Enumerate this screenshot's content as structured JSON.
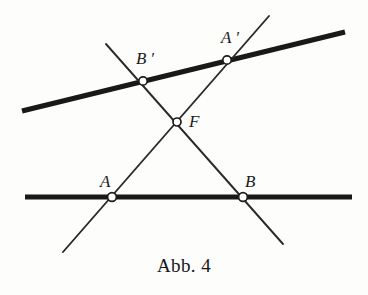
{
  "figure": {
    "caption": "Abb. 4",
    "caption_x": 184,
    "caption_y": 255,
    "caption_font_size": 19,
    "background_color": "#fdfdfc",
    "ink_color": "#1c1c1c",
    "canvas": {
      "width": 368,
      "height": 295
    }
  },
  "labels": [
    {
      "name": "label-b-prime",
      "text": "B ′",
      "x": 136,
      "y": 50,
      "font_size": 17
    },
    {
      "name": "label-a-prime",
      "text": "A ′",
      "x": 221,
      "y": 29,
      "font_size": 17
    },
    {
      "name": "label-f",
      "text": "F",
      "x": 189,
      "y": 113,
      "font_size": 17
    },
    {
      "name": "label-a",
      "text": "A",
      "x": 100,
      "y": 173,
      "font_size": 17
    },
    {
      "name": "label-b",
      "text": "B",
      "x": 245,
      "y": 173,
      "font_size": 17
    }
  ],
  "chart_data": {
    "type": "diagram",
    "title": "Abb. 4",
    "xlim": [
      0,
      368
    ],
    "ylim": [
      0,
      295
    ],
    "grid": false,
    "legend": null,
    "lines": [
      {
        "name": "upper-thick-line",
        "style": "thick",
        "stroke_width": 5.2,
        "color": "#191919",
        "x1": 22,
        "y1": 111,
        "x2": 345,
        "y2": 32
      },
      {
        "name": "lower-thick-line",
        "style": "thick",
        "stroke_width": 5.0,
        "color": "#191919",
        "x1": 25,
        "y1": 197,
        "x2": 352,
        "y2": 197
      },
      {
        "name": "transversal-b-prime-to-b",
        "style": "thin",
        "stroke_width": 1.9,
        "color": "#2a2a2a",
        "x1": 106,
        "y1": 44,
        "x2": 283,
        "y2": 244
      },
      {
        "name": "transversal-a-prime-to-a",
        "style": "thin",
        "stroke_width": 1.9,
        "color": "#2a2a2a",
        "x1": 269,
        "y1": 16,
        "x2": 63,
        "y2": 252
      }
    ],
    "points": [
      {
        "name": "point-b-prime",
        "label": "B′",
        "x": 143,
        "y": 81,
        "radius": 4.2,
        "fill": "#ffffff",
        "stroke": "#1c1c1c"
      },
      {
        "name": "point-a-prime",
        "label": "A′",
        "x": 227,
        "y": 60,
        "radius": 4.2,
        "fill": "#ffffff",
        "stroke": "#1c1c1c"
      },
      {
        "name": "point-f",
        "label": "F",
        "x": 177,
        "y": 122,
        "radius": 4.0,
        "fill": "#ffffff",
        "stroke": "#1c1c1c"
      },
      {
        "name": "point-a",
        "label": "A",
        "x": 112,
        "y": 197,
        "radius": 4.4,
        "fill": "#ffffff",
        "stroke": "#1c1c1c"
      },
      {
        "name": "point-b",
        "label": "B",
        "x": 243,
        "y": 197,
        "radius": 4.4,
        "fill": "#ffffff",
        "stroke": "#1c1c1c"
      }
    ]
  }
}
